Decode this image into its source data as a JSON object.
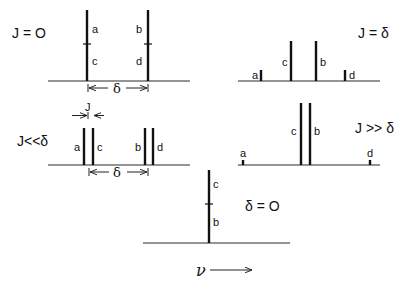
{
  "figure": {
    "axis_label": "ν",
    "panels": [
      {
        "id": "j-zero",
        "condition": "J = O",
        "peaks": [
          {
            "pos": 0.0,
            "intensity": 1.0,
            "labels": [
              "a",
              "c"
            ]
          },
          {
            "pos": 1.0,
            "intensity": 1.0,
            "labels": [
              "b",
              "d"
            ]
          }
        ],
        "dimension": {
          "label": "δ",
          "from": 0.0,
          "to": 1.0
        }
      },
      {
        "id": "j-equals-delta",
        "condition": "J = δ",
        "peaks": [
          {
            "pos": 0.0,
            "intensity": 0.15,
            "labels": [
              "a"
            ]
          },
          {
            "pos": 0.35,
            "intensity": 0.55,
            "labels": [
              "c"
            ]
          },
          {
            "pos": 0.65,
            "intensity": 0.55,
            "labels": [
              "b"
            ]
          },
          {
            "pos": 1.0,
            "intensity": 0.15,
            "labels": [
              "d"
            ]
          }
        ]
      },
      {
        "id": "j-much-less-delta",
        "condition": "J<<δ",
        "peaks": [
          {
            "pos": 0.0,
            "intensity": 0.5,
            "labels": [
              "a"
            ]
          },
          {
            "pos": 0.13,
            "intensity": 0.5,
            "labels": [
              "c"
            ]
          },
          {
            "pos": 0.87,
            "intensity": 0.5,
            "labels": [
              "b"
            ]
          },
          {
            "pos": 1.0,
            "intensity": 0.5,
            "labels": [
              "d"
            ]
          }
        ],
        "coupling_label": "J",
        "dimension": {
          "label": "δ",
          "from": 0.07,
          "to": 0.93
        }
      },
      {
        "id": "j-much-greater-delta",
        "condition": "J >> δ",
        "peaks": [
          {
            "pos": 0.0,
            "intensity": 0.06,
            "labels": [
              "a"
            ]
          },
          {
            "pos": 0.46,
            "intensity": 0.95,
            "labels": [
              "c"
            ]
          },
          {
            "pos": 0.54,
            "intensity": 0.95,
            "labels": [
              "b"
            ]
          },
          {
            "pos": 1.0,
            "intensity": 0.06,
            "labels": [
              "d"
            ]
          }
        ]
      },
      {
        "id": "delta-zero",
        "condition": "δ = O",
        "peaks": [
          {
            "pos": 0.5,
            "intensity": 1.0,
            "labels": [
              "b",
              "c"
            ]
          }
        ]
      }
    ]
  }
}
